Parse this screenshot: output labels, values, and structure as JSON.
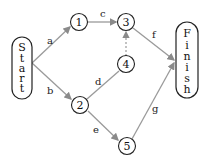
{
  "diagram": {
    "type": "network-activity-graph",
    "start": {
      "label": "Start",
      "letters": [
        "S",
        "t",
        "a",
        "r",
        "t"
      ]
    },
    "finish": {
      "label": "Finish",
      "letters": [
        "F",
        "i",
        "n",
        "i",
        "s",
        "h"
      ]
    },
    "nodes": [
      {
        "id": "1",
        "label": "1"
      },
      {
        "id": "2",
        "label": "2"
      },
      {
        "id": "3",
        "label": "3"
      },
      {
        "id": "4",
        "label": "4"
      },
      {
        "id": "5",
        "label": "5"
      }
    ],
    "edges": [
      {
        "from": "Start",
        "to": "1",
        "label": "a",
        "style": "solid"
      },
      {
        "from": "Start",
        "to": "2",
        "label": "b",
        "style": "solid"
      },
      {
        "from": "1",
        "to": "3",
        "label": "c",
        "style": "solid"
      },
      {
        "from": "2",
        "to": "4",
        "label": "d",
        "style": "solid"
      },
      {
        "from": "2",
        "to": "5",
        "label": "e",
        "style": "solid"
      },
      {
        "from": "3",
        "to": "Finish",
        "label": "f",
        "style": "solid"
      },
      {
        "from": "5",
        "to": "Finish",
        "label": "g",
        "style": "solid"
      },
      {
        "from": "4",
        "to": "3",
        "label": "",
        "style": "dashed"
      }
    ],
    "colors": {
      "edge": "#9a9a9a",
      "node_stroke": "#222222",
      "text": "#222222"
    }
  }
}
